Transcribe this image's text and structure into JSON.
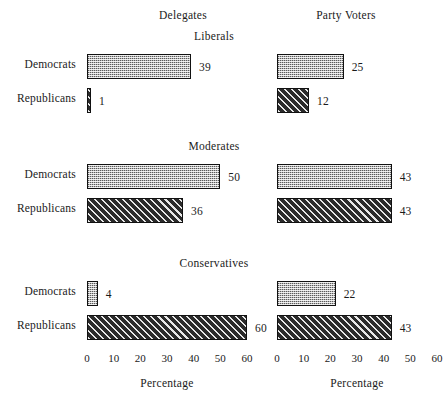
{
  "chart_data": {
    "type": "bar",
    "orientation": "horizontal",
    "title": "",
    "xlabel": "Percentage",
    "ylabel": "",
    "xlim": [
      0,
      60
    ],
    "xticks": [
      0,
      10,
      20,
      30,
      40,
      50,
      60
    ],
    "grid": false,
    "legend": "none",
    "column_headers": [
      "Delegates",
      "Party Voters"
    ],
    "row_categories": [
      "Democrats",
      "Republicans"
    ],
    "panels": [
      {
        "title": "Liberals",
        "rows": [
          {
            "label": "Democrats",
            "values": [
              39,
              25
            ]
          },
          {
            "label": "Republicans",
            "values": [
              1,
              12
            ]
          }
        ]
      },
      {
        "title": "Moderates",
        "rows": [
          {
            "label": "Democrats",
            "values": [
              50,
              43
            ]
          },
          {
            "label": "Republicans",
            "values": [
              36,
              43
            ]
          }
        ]
      },
      {
        "title": "Conservatives",
        "rows": [
          {
            "label": "Democrats",
            "values": [
              4,
              22
            ]
          },
          {
            "label": "Republicans",
            "values": [
              60,
              43
            ]
          }
        ]
      }
    ],
    "series": [
      {
        "name": "Delegates",
        "categories": [
          "Liberals-Democrats",
          "Liberals-Republicans",
          "Moderates-Democrats",
          "Moderates-Republicans",
          "Conservatives-Democrats",
          "Conservatives-Republicans"
        ],
        "values": [
          39,
          1,
          50,
          36,
          4,
          60
        ]
      },
      {
        "name": "Party Voters",
        "categories": [
          "Liberals-Democrats",
          "Liberals-Republicans",
          "Moderates-Democrats",
          "Moderates-Republicans",
          "Conservatives-Democrats",
          "Conservatives-Republicans"
        ],
        "values": [
          25,
          12,
          43,
          43,
          22,
          43
        ]
      }
    ],
    "colors": {
      "democrat_fill": "#b9b9b9",
      "republican_fill": "#2b2b2b",
      "outline": "#111111",
      "text": "#1a1a1a",
      "background": "#ffffff"
    },
    "axis_titles": [
      "Percentage",
      "Percentage"
    ]
  }
}
